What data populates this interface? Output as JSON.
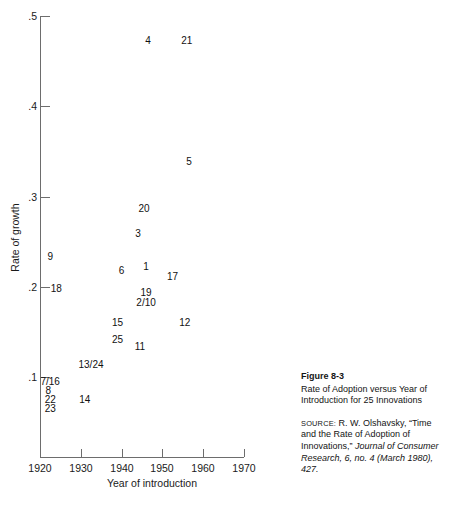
{
  "chart_data": {
    "type": "scatter",
    "title": "Rate of Adoption versus Year of Introduction for 25 Innovations",
    "xlabel": "Year of introduction",
    "ylabel": "Rate of growth",
    "xlim": [
      1920,
      1970
    ],
    "ylim": [
      0.05,
      0.5
    ],
    "xticks": [
      "1920",
      "1930",
      "1940",
      "1950",
      "1960",
      "1970"
    ],
    "xtick_values": [
      1920,
      1930,
      1940,
      1950,
      1960,
      1970
    ],
    "yticks": [
      ".5",
      ".4",
      ".3",
      ".2",
      ".1"
    ],
    "ytick_values": [
      0.5,
      0.4,
      0.3,
      0.2,
      0.1
    ],
    "grid": false,
    "legend": false,
    "marker_style": "numeric-label",
    "points": [
      {
        "label": "4",
        "x": 1946.5,
        "y": 0.472
      },
      {
        "label": "21",
        "x": 1956.0,
        "y": 0.472
      },
      {
        "label": "5",
        "x": 1956.5,
        "y": 0.338
      },
      {
        "label": "20",
        "x": 1945.5,
        "y": 0.286
      },
      {
        "label": "3",
        "x": 1944.0,
        "y": 0.258
      },
      {
        "label": "9",
        "x": 1922.5,
        "y": 0.233
      },
      {
        "label": "6",
        "x": 1940.0,
        "y": 0.218
      },
      {
        "label": "1",
        "x": 1946.0,
        "y": 0.222
      },
      {
        "label": "17",
        "x": 1952.5,
        "y": 0.211
      },
      {
        "label": "18",
        "x": 1924.0,
        "y": 0.198
      },
      {
        "label": "19",
        "x": 1946.0,
        "y": 0.193
      },
      {
        "label": "2/10",
        "x": 1946.0,
        "y": 0.182
      },
      {
        "label": "15",
        "x": 1939.0,
        "y": 0.16
      },
      {
        "label": "12",
        "x": 1955.5,
        "y": 0.16
      },
      {
        "label": "25",
        "x": 1939.0,
        "y": 0.141
      },
      {
        "label": "11",
        "x": 1944.5,
        "y": 0.133
      },
      {
        "label": "13/24",
        "x": 1932.5,
        "y": 0.113
      },
      {
        "label": "7/16",
        "x": 1922.5,
        "y": 0.094
      },
      {
        "label": "8",
        "x": 1922.0,
        "y": 0.084
      },
      {
        "label": "22",
        "x": 1922.5,
        "y": 0.074
      },
      {
        "label": "23",
        "x": 1922.5,
        "y": 0.064
      },
      {
        "label": "14",
        "x": 1931.0,
        "y": 0.074
      }
    ]
  },
  "axes": {
    "y_title": "Rate of growth",
    "x_title": "Year of introduction",
    "y_labels": [
      ".5",
      ".4",
      ".3",
      ".2",
      ".1"
    ],
    "x_labels": [
      "1920",
      "1930",
      "1940",
      "1950",
      "1960",
      "1970"
    ]
  },
  "caption": {
    "figure_number": "Figure 8-3",
    "description": "Rate of Adoption versus Year of Introduction for 25 Innovations",
    "source_word": "SOURCE:",
    "source_part1": "R. W. Olshavsky, “Time and the Rate of Adoption of Innovations,”",
    "source_journal": "Journal of Consumer Research",
    "source_part2": ", 6, no. 4 (March 1980), 427."
  }
}
